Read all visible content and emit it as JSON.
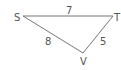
{
  "diagram": {
    "type": "triangle",
    "stroke_color": "#777777",
    "text_color": "#555555",
    "vertices": [
      {
        "name": "S",
        "x": 23,
        "y": 16
      },
      {
        "name": "T",
        "x": 113,
        "y": 16
      },
      {
        "name": "V",
        "x": 83,
        "y": 53
      }
    ],
    "edges": [
      {
        "from": "S",
        "to": "T",
        "length": "7"
      },
      {
        "from": "S",
        "to": "V",
        "length": "8"
      },
      {
        "from": "T",
        "to": "V",
        "length": "5"
      }
    ]
  }
}
